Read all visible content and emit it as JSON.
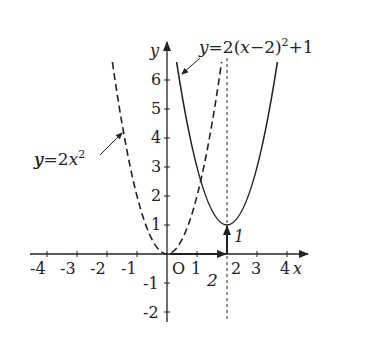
{
  "diagram": {
    "axes": {
      "x_label": "x",
      "y_label": "y",
      "origin_label": "O",
      "x_ticks": [
        "-4",
        "-3",
        "-2",
        "-1",
        "1",
        "2",
        "3",
        "4"
      ],
      "y_ticks": [
        "6",
        "5",
        "4",
        "3",
        "2",
        "1",
        "-1",
        "-2"
      ]
    },
    "curves": [
      {
        "name": "base-parabola",
        "label_prefix": "y=2x",
        "label_exp": "2",
        "style": "dashed",
        "vertex": [
          0,
          0
        ]
      },
      {
        "name": "translated-parabola",
        "label_prefix": "y=2(x−2)",
        "label_exp": "2",
        "label_suffix": "+1",
        "style": "solid",
        "vertex": [
          2,
          1
        ]
      }
    ],
    "translation": {
      "horizontal_label": "2",
      "vertical_label": "1",
      "axis_of_symmetry_x": 2
    },
    "colors": {
      "stroke": "#222222",
      "background": "#ffffff"
    }
  }
}
